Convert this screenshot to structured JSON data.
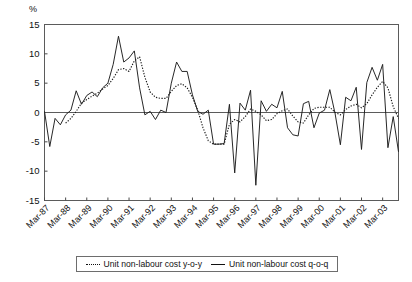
{
  "chart_data": {
    "type": "line",
    "title": "",
    "subtitle": "",
    "xlabel": "",
    "ylabel": "%",
    "unit_label": "%",
    "ylim": [
      -15,
      15
    ],
    "yticks": [
      15,
      10,
      5,
      0,
      -5,
      -10,
      -15
    ],
    "ytick_labels": [
      "15",
      "10",
      "5",
      "0",
      "-5",
      "-10",
      "-15"
    ],
    "grid": false,
    "zero_line": true,
    "legend_position": "bottom",
    "xlim_labels": [
      "Mar-87",
      "Mar-03"
    ],
    "categories": [
      "Mar-87",
      "Jun-87",
      "Sep-87",
      "Dec-87",
      "Mar-88",
      "Jun-88",
      "Sep-88",
      "Dec-88",
      "Mar-89",
      "Jun-89",
      "Sep-89",
      "Dec-89",
      "Mar-90",
      "Jun-90",
      "Sep-90",
      "Dec-90",
      "Mar-91",
      "Jun-91",
      "Sep-91",
      "Dec-91",
      "Mar-92",
      "Jun-92",
      "Sep-92",
      "Dec-92",
      "Mar-93",
      "Jun-93",
      "Sep-93",
      "Dec-93",
      "Mar-94",
      "Jun-94",
      "Sep-94",
      "Dec-94",
      "Mar-95",
      "Jun-95",
      "Sep-95",
      "Dec-95",
      "Mar-96",
      "Jun-96",
      "Sep-96",
      "Dec-96",
      "Mar-97",
      "Jun-97",
      "Sep-97",
      "Dec-97",
      "Mar-98",
      "Jun-98",
      "Sep-98",
      "Dec-98",
      "Mar-99",
      "Jun-99",
      "Sep-99",
      "Dec-99",
      "Mar-00",
      "Jun-00",
      "Sep-00",
      "Dec-00",
      "Mar-01",
      "Jun-01",
      "Sep-01",
      "Dec-01",
      "Mar-02",
      "Jun-02",
      "Sep-02",
      "Dec-02",
      "Mar-03",
      "Jun-03",
      "Sep-03",
      "Dec-03"
    ],
    "xticks": [
      "Mar-87",
      "Mar-88",
      "Mar-89",
      "Mar-90",
      "Mar-91",
      "Mar-92",
      "Mar-93",
      "Mar-94",
      "Mar-95",
      "Mar-96",
      "Mar-97",
      "Mar-98",
      "Mar-99",
      "Mar-00",
      "Mar-01",
      "Mar-02",
      "Mar-03"
    ],
    "series": [
      {
        "name": "Unit non-labour cost y-o-y",
        "style": "dotted",
        "values": [
          null,
          null,
          null,
          null,
          -1.8,
          -1.0,
          0.2,
          1.6,
          2.2,
          2.8,
          3.3,
          4.0,
          4.6,
          5.8,
          7.3,
          7.5,
          7.0,
          8.8,
          9.5,
          6.0,
          3.5,
          2.6,
          2.4,
          2.4,
          3.6,
          4.6,
          4.9,
          4.2,
          2.6,
          0.4,
          -2.6,
          -4.8,
          -5.4,
          -5.4,
          -5.4,
          -2.0,
          -1.2,
          -1.6,
          -0.7,
          0.6,
          0.2,
          -0.4,
          -1.4,
          -1.2,
          -0.2,
          0.3,
          0.6,
          -0.6,
          -1.6,
          -1.8,
          -0.4,
          0.7,
          0.9,
          0.9,
          0.9,
          0.0,
          -0.4,
          0.5,
          1.1,
          1.4,
          0.8,
          1.5,
          3.0,
          4.3,
          5.3,
          4.2,
          1.0,
          -1.0
        ]
      },
      {
        "name": "Unit non-labour cost q-o-q",
        "style": "solid",
        "values": [
          0.2,
          -5.8,
          -1.0,
          -2.1,
          -0.4,
          0.4,
          3.7,
          1.4,
          2.9,
          3.5,
          2.7,
          4.2,
          5.0,
          8.2,
          13.0,
          8.6,
          9.3,
          10.5,
          4.2,
          -0.4,
          0.2,
          -1.2,
          0.4,
          0.0,
          5.0,
          8.6,
          7.0,
          7.0,
          3.0,
          0.2,
          -0.3,
          0.4,
          -5.4,
          -5.4,
          -5.3,
          1.4,
          -10.3,
          1.6,
          0.4,
          3.8,
          -12.4,
          2.0,
          0.2,
          1.4,
          0.8,
          3.6,
          -2.6,
          -3.8,
          -4.0,
          1.5,
          1.9,
          -2.6,
          -0.1,
          0.4,
          3.9,
          -0.2,
          -5.5,
          2.6,
          2.0,
          4.3,
          -6.3,
          5.1,
          7.7,
          5.5,
          8.2,
          -6.0,
          -0.7,
          -6.7
        ]
      }
    ],
    "legend": [
      {
        "label": "Unit non-labour cost y-o-y",
        "marker": "dotted-line-swatch"
      },
      {
        "label": "Unit non-labour cost q-o-q",
        "marker": "solid-line-swatch"
      }
    ],
    "colors": {
      "series_line": "#1b1b1b",
      "axis": "#5b5b5b",
      "text": "#111111",
      "background": "#ffffff"
    }
  }
}
